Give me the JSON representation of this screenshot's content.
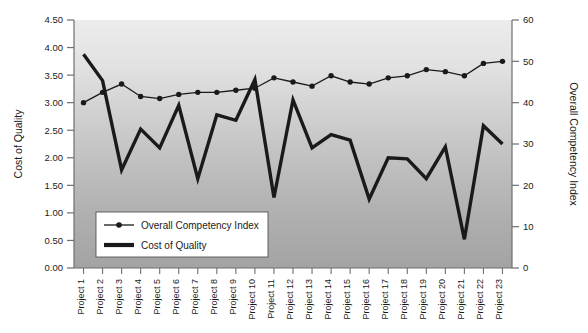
{
  "chart_data": {
    "type": "line",
    "title": "",
    "xlabel": "",
    "ylabel": "Cost of Quality",
    "y2label": "Overall Competency Index",
    "ylim": [
      0.0,
      4.5
    ],
    "y2lim": [
      0,
      60
    ],
    "grid": false,
    "legend_position": "inside-bottom-left",
    "categories": [
      "Project 1",
      "Project 2",
      "Project 3",
      "Project 4",
      "Project 5",
      "Project 6",
      "Project 7",
      "Project 8",
      "Project 9",
      "Project 10",
      "Project 11",
      "Project 12",
      "Project 13",
      "Project 14",
      "Project 15",
      "Project 16",
      "Project 17",
      "Project 18",
      "Project 19",
      "Project 20",
      "Project 21",
      "Project 22",
      "Project 23"
    ],
    "y_ticks": [
      "0.00",
      "0.50",
      "1.00",
      "1.50",
      "2.00",
      "2.50",
      "3.00",
      "3.50",
      "4.00",
      "4.50"
    ],
    "y2_ticks": [
      "0",
      "10",
      "20",
      "30",
      "40",
      "50",
      "60"
    ],
    "series": [
      {
        "name": "Overall Competency Index",
        "axis": "right",
        "marker": "circle",
        "line_width": 1.3,
        "color": "#1a1a1a",
        "values": [
          40.0,
          42.5,
          44.5,
          41.5,
          41.0,
          42.0,
          42.5,
          42.5,
          43.0,
          43.5,
          46.0,
          45.0,
          44.0,
          46.5,
          45.0,
          44.5,
          46.0,
          46.5,
          48.0,
          47.5,
          46.5,
          49.5,
          50.0
        ]
      },
      {
        "name": "Cost of Quality",
        "axis": "left",
        "marker": "none",
        "line_width": 3.4,
        "color": "#1a1a1a",
        "values": [
          3.88,
          3.4,
          1.78,
          2.52,
          2.18,
          2.95,
          1.62,
          2.78,
          2.68,
          3.42,
          1.28,
          3.05,
          2.18,
          2.42,
          2.32,
          1.25,
          2.0,
          1.98,
          1.62,
          2.2,
          0.52,
          2.58,
          2.25
        ]
      }
    ],
    "legend": [
      {
        "label": "Overall Competency Index",
        "style": "line-marker"
      },
      {
        "label": "Cost of Quality",
        "style": "thick-line"
      }
    ],
    "colors": {
      "plot_gradient_top": "#eaeaea",
      "plot_gradient_bottom": "#a6a6a6",
      "line": "#1a1a1a",
      "axis": "#6f6f6f",
      "text": "#1a1a1a",
      "legend_bg": "#ffffff",
      "page_bg": "#ffffff"
    }
  }
}
